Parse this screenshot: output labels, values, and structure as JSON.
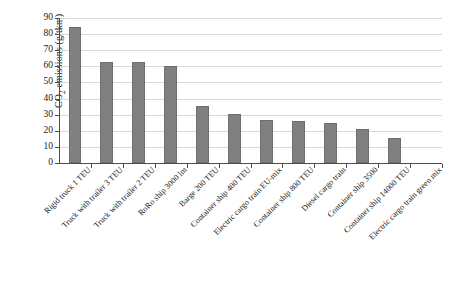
{
  "chart_data": {
    "type": "bar",
    "title": "",
    "xlabel": "",
    "ylabel": "CO2 emissions (g/tkm)",
    "ylabel_parts": {
      "prefix": "CO",
      "sub": "2",
      "suffix": " emissions (g/tkm)"
    },
    "ylim": [
      0,
      90
    ],
    "ytick_step": 10,
    "yticks": [
      0,
      10,
      20,
      30,
      40,
      50,
      60,
      70,
      80,
      90
    ],
    "ytick_labels": [
      "0",
      "10",
      "20",
      "30",
      "40",
      "50",
      "60",
      "70",
      "80",
      "90"
    ],
    "grid": true,
    "legend": "none",
    "bar_color": "#808080",
    "bar_edge_color": "#6e6e6e",
    "categories": [
      "Rigid truck 1 TEU",
      "Truck with trailer 3 TEU",
      "Truck with trailer 2 TEU",
      "RoRo ship 3000 lm",
      "Barge 200 TEU",
      "Container ship 400 TEU",
      "Electric cargo train EU-mix",
      "Container ship 800 TEU",
      "Diesel cargo train",
      "Container ship 3500",
      "Container ship 14000 TEU",
      "Electric cargo train green mix"
    ],
    "values": [
      84.5,
      63,
      62.5,
      60,
      35.5,
      30.5,
      26.5,
      26,
      25,
      21,
      15.5,
      0
    ]
  }
}
